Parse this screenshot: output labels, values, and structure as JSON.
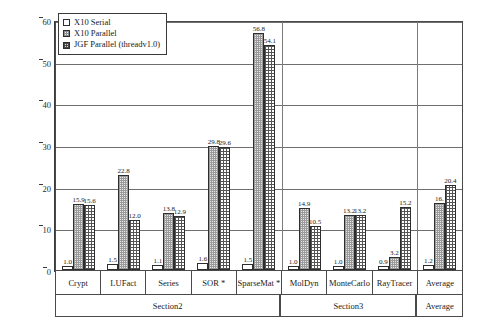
{
  "chart_data": {
    "type": "bar",
    "title": "",
    "xlabel": "",
    "ylabel": "Speedup w.r.t. JGF serial (v2.0)",
    "ylim": [
      0,
      60
    ],
    "yticks": [
      0,
      10,
      20,
      30,
      40,
      50,
      60
    ],
    "grid": true,
    "legend_position": "top-left",
    "categories": [
      "Crypt",
      "LUFact",
      "Series",
      "SOR *",
      "SparseMat *",
      "MolDyn",
      "MonteCarlo",
      "RayTracer",
      "Average"
    ],
    "series": [
      {
        "name": "X10 Serial",
        "values": [
          1.0,
          1.5,
          1.1,
          1.6,
          1.5,
          1.0,
          1.0,
          0.9,
          1.2
        ]
      },
      {
        "name": "X10 Parallel",
        "values": [
          15.9,
          22.8,
          13.8,
          29.8,
          56.8,
          14.9,
          13.2,
          3.2,
          16.0
        ]
      },
      {
        "name": "JGF Parallel (threadv1.0)",
        "values": [
          15.6,
          12.0,
          12.9,
          29.6,
          54.1,
          10.5,
          13.2,
          15.2,
          20.4
        ]
      }
    ],
    "value_labels": [
      [
        "1.0",
        "1.5",
        "1.1",
        "1.6",
        "1.5",
        "1.0",
        "1.0",
        "0.9",
        "1.2"
      ],
      [
        "15.9",
        "22.8",
        "13.8",
        "29.8",
        "56.8",
        "14.9",
        "13.2",
        "3.2",
        "16."
      ],
      [
        "15.6",
        "12.0",
        "12.9",
        "29.6",
        "54.1",
        "10.5",
        "13.2",
        "15.2",
        "20.4"
      ]
    ],
    "sections": [
      {
        "label": "Section2",
        "span": 5
      },
      {
        "label": "Section3",
        "span": 3
      },
      {
        "label": "Average",
        "span": 1
      }
    ]
  },
  "legend": {
    "items": [
      {
        "label": "X10 Serial"
      },
      {
        "label": "X10 Parallel"
      },
      {
        "label": "JGF Parallel (threadv1.0)"
      }
    ]
  }
}
